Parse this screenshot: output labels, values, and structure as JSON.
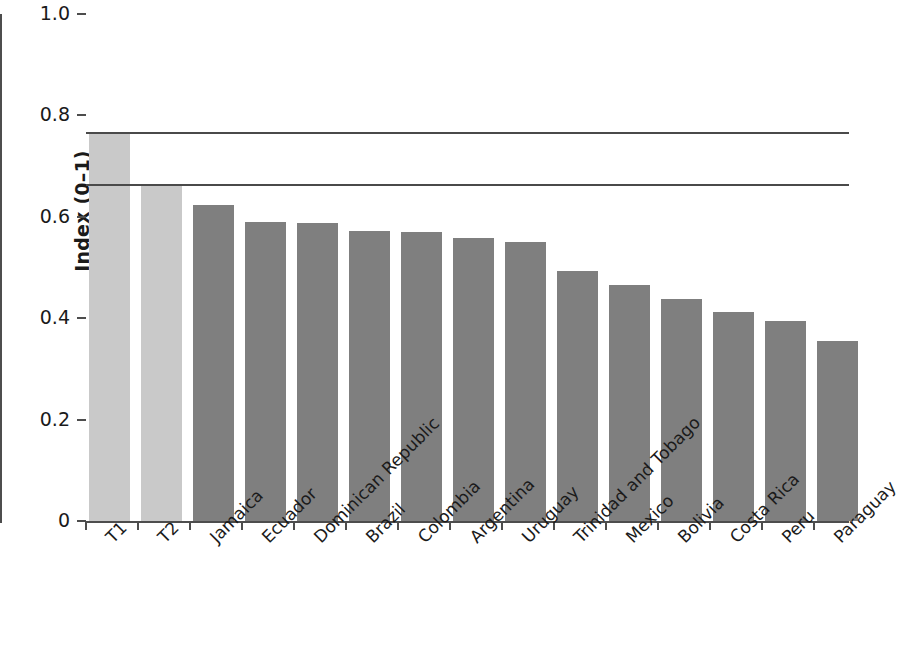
{
  "chart_data": {
    "type": "bar",
    "title": "",
    "subtitle": "",
    "xlabel": "",
    "ylabel": "Index (0–1)",
    "ylim": [
      0,
      1.0
    ],
    "ytick_labels": [
      "0",
      "0.2",
      "0.4",
      "0.6",
      "0.8",
      "1.0"
    ],
    "ytick_values": [
      0,
      0.2,
      0.4,
      0.6,
      0.8,
      1.0
    ],
    "grid": false,
    "legend": null,
    "categories": [
      "T1",
      "T2",
      "Jamaica",
      "Ecuador",
      "Dominican Republic",
      "Brazil",
      "Colombia",
      "Argentina",
      "Uruguay",
      "Trinidad and Tobago",
      "Mexico",
      "Bolivia",
      "Costa Rica",
      "Peru",
      "Paraguay"
    ],
    "values": [
      0.765,
      0.663,
      0.623,
      0.59,
      0.587,
      0.573,
      0.571,
      0.558,
      0.551,
      0.493,
      0.466,
      0.437,
      0.413,
      0.395,
      0.355
    ],
    "bar_colors": [
      "#c9c9c9",
      "#c9c9c9",
      "#7f7f7f",
      "#7f7f7f",
      "#7f7f7f",
      "#7f7f7f",
      "#7f7f7f",
      "#7f7f7f",
      "#7f7f7f",
      "#7f7f7f",
      "#7f7f7f",
      "#7f7f7f",
      "#7f7f7f",
      "#7f7f7f",
      "#7f7f7f"
    ],
    "reference_lines": [
      {
        "value": 0.765,
        "label": ""
      },
      {
        "value": 0.663,
        "label": ""
      }
    ],
    "colors": {
      "benchmark_bar": "#c9c9c9",
      "country_bar": "#7f7f7f",
      "axis": "#4d4d4d",
      "reference_line": "#4a4a4a"
    }
  }
}
